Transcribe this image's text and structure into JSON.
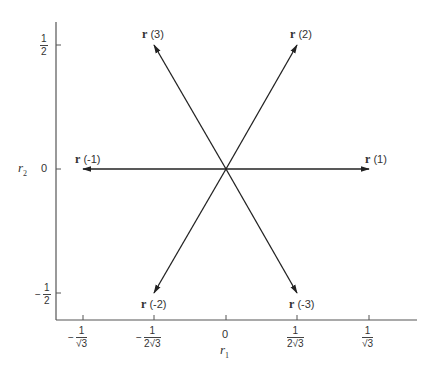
{
  "figure": {
    "axes": {
      "x_label": "r",
      "x_label_sub": "1",
      "y_label": "r",
      "y_label_sub": "2",
      "x_ticks": [
        {
          "sign": "−",
          "num": "1",
          "den": "√3",
          "value": -0.577
        },
        {
          "sign": "−",
          "num": "1",
          "den": "2√3",
          "value": -0.289
        },
        {
          "sign": "",
          "text": "0",
          "value": 0
        },
        {
          "sign": "",
          "num": "1",
          "den": "2√3",
          "value": 0.289
        },
        {
          "sign": "",
          "num": "1",
          "den": "√3",
          "value": 0.577
        }
      ],
      "y_ticks": [
        {
          "sign": "",
          "num": "1",
          "den": "2",
          "value": 0.5
        },
        {
          "sign": "",
          "text": "0",
          "value": 0
        },
        {
          "sign": "−",
          "num": "1",
          "den": "2",
          "value": -0.5
        }
      ]
    },
    "vectors": [
      {
        "name": "r",
        "index": "(1)",
        "x": 0.577,
        "y": 0
      },
      {
        "name": "r",
        "index": "(2)",
        "x": 0.289,
        "y": 0.5
      },
      {
        "name": "r",
        "index": "(3)",
        "x": -0.289,
        "y": 0.5
      },
      {
        "name": "r",
        "index": "(-1)",
        "x": -0.577,
        "y": 0
      },
      {
        "name": "r",
        "index": "(-2)",
        "x": -0.289,
        "y": -0.5
      },
      {
        "name": "r",
        "index": "(-3)",
        "x": 0.289,
        "y": -0.5
      }
    ],
    "line_color": "#333333"
  }
}
